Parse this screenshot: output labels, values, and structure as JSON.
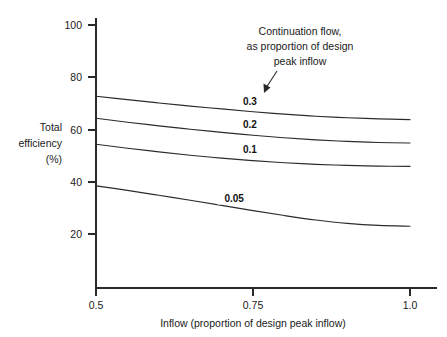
{
  "chart_data": {
    "type": "line",
    "title": "",
    "subtitle": "",
    "xlabel": "Inflow (proportion of design peak inflow)",
    "ylabel": "Total efficiency (%)",
    "ylabel_lines": [
      "Total",
      "efficiency",
      "(%)"
    ],
    "xlim": [
      0.5,
      1.0
    ],
    "ylim": [
      0,
      100
    ],
    "xticks": [
      0.5,
      0.75,
      1.0
    ],
    "xtick_labels": [
      "0.5",
      "0.75",
      "1.0"
    ],
    "yticks": [
      20,
      40,
      60,
      80,
      100
    ],
    "ytick_labels": [
      "20",
      "40",
      "60",
      "80",
      "100"
    ],
    "grid": false,
    "legend_position": "inline-labels",
    "annotations": [
      {
        "name": "continuation-flow-note",
        "lines": [
          "Continuation flow,",
          "as proportion of design",
          "peak inflow"
        ],
        "points_to_series": "0.3"
      }
    ],
    "x": [
      0.5,
      0.55,
      0.6,
      0.65,
      0.7,
      0.75,
      0.8,
      0.85,
      0.9,
      0.95,
      1.0
    ],
    "series": [
      {
        "name": "0.3",
        "label": "0.3",
        "values": [
          73.0,
          71.7,
          70.4,
          69.2,
          68.1,
          67.0,
          66.1,
          65.3,
          64.7,
          64.3,
          64.0
        ]
      },
      {
        "name": "0.2",
        "label": "0.2",
        "values": [
          64.5,
          63.0,
          61.6,
          60.3,
          59.1,
          58.0,
          57.0,
          56.2,
          55.6,
          55.2,
          55.0
        ]
      },
      {
        "name": "0.1",
        "label": "0.1",
        "values": [
          54.5,
          53.0,
          51.6,
          50.3,
          49.2,
          48.2,
          47.4,
          46.8,
          46.4,
          46.1,
          46.0
        ]
      },
      {
        "name": "0.05",
        "label": "0.05",
        "values": [
          38.5,
          36.8,
          34.9,
          33.0,
          31.0,
          29.0,
          27.1,
          25.4,
          24.1,
          23.3,
          23.0
        ]
      }
    ],
    "series_label_positions": [
      {
        "name": "0.3",
        "x": 0.745,
        "y": 69.5
      },
      {
        "name": "0.2",
        "x": 0.745,
        "y": 60.6
      },
      {
        "name": "0.1",
        "x": 0.745,
        "y": 51.2
      },
      {
        "name": "0.05",
        "x": 0.72,
        "y": 32.5
      }
    ],
    "colors": {
      "line": "#2b2b2b",
      "axis": "#2a2a2a",
      "text": "#1a1a1a",
      "background": "#ffffff"
    }
  }
}
